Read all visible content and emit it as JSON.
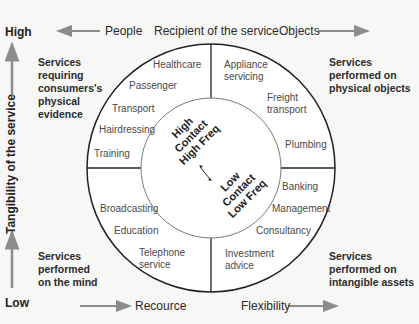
{
  "axes": {
    "vertical": {
      "label": "Tangibility of the service",
      "high": "High",
      "low": "Low"
    },
    "top": {
      "left": "People",
      "center": "Recipient of the service",
      "right": "Objects"
    },
    "bottom": {
      "left": "Recource",
      "right": "Flexibility"
    }
  },
  "quadrants": {
    "top_left": "Services requiring consumers's physical evidence",
    "top_right": "Services performed on physical objects",
    "bottom_left": "Services performed on the mind",
    "bottom_right": "Services performed on intangible assets"
  },
  "services": {
    "top_left": [
      "Healthcare",
      "Passenger",
      "Transport",
      "Hairdressing",
      "Training"
    ],
    "top_right": [
      "Appliance servicing",
      "Freight transport",
      "Plumbing"
    ],
    "bottom_left": [
      "Broadcasting",
      "Education",
      "Telephone service"
    ],
    "bottom_right": [
      "Banking",
      "Management",
      "Consultancy",
      "Investment advice"
    ]
  },
  "center": {
    "high": [
      "High",
      "Contact",
      "High Freq"
    ],
    "low": [
      "Low",
      "Contact",
      "Low Freq"
    ],
    "arrow": "double-arrow-icon"
  },
  "colors": {
    "background": "#f7f7f6",
    "arrow": "#8c8c8c",
    "circle_outer": "#222222",
    "circle_inner": "#7a7a7a"
  }
}
